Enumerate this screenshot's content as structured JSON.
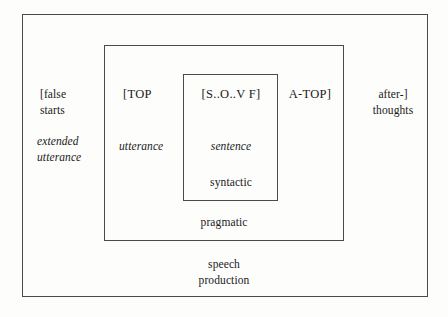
{
  "figure": {
    "stroke_color": "#4a4a4a",
    "background_color": "#fdfdfc",
    "text_color": "#1a1a1a"
  },
  "frames": {
    "outer": {
      "level_label": "speech\nproduction"
    },
    "middle": {
      "level_label": "pragmatic"
    },
    "inner": {
      "level_label": "syntactic"
    }
  },
  "labels": {
    "false_starts": "[false\nstarts",
    "extended_utterance": "extended\nutterance",
    "top": "[TOP",
    "utterance": "utterance",
    "sov": "[S..O..V F]",
    "sentence": "sentence",
    "syntactic": "syntactic",
    "atop": "A-TOP]",
    "afterthoughts": "after-]\nthoughts",
    "pragmatic": "pragmatic",
    "speech_production": "speech\nproduction"
  }
}
